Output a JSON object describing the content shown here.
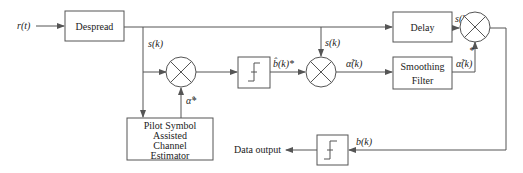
{
  "diagram": {
    "input_label": "r(t)",
    "blocks": {
      "despread": "Despread",
      "delay": "Delay",
      "smoothing_line1": "Smoothing",
      "smoothing_line2": "Filter",
      "psa_line1": "Pilot Symbol",
      "psa_line2": "Assisted",
      "psa_line3": "Channel",
      "psa_line4": "Estimator"
    },
    "signals": {
      "s_k_branch_left": "s(k)",
      "s_k_branch_mid": "s(k)",
      "s_k_delay_out": "s(k)",
      "alpha_hat_conj": "α̂*",
      "b_hat_conj": "b̂(k)*",
      "alpha_tilde_in": "α̃(k)",
      "alpha_tilde_out": "α̃(k)",
      "conj_mark": "*",
      "b_k": "b(k)"
    },
    "output_label": "Data output",
    "colors": {
      "line": "#555555",
      "text": "#222222",
      "background": "#ffffff"
    }
  }
}
